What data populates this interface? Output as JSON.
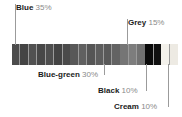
{
  "chart_data": {
    "type": "bar",
    "title": "",
    "subtitle": "",
    "xlabel": "",
    "ylabel": "",
    "orientation": "horizontal-stacked",
    "grid": false,
    "legend_position": "callout-labels",
    "total_percent": 100,
    "categories": [
      "Blue",
      "Blue-green",
      "Grey",
      "Black",
      "Cream"
    ],
    "values": [
      35,
      30,
      15,
      10,
      10
    ],
    "series": [
      {
        "name": "Color proportion",
        "values": [
          35,
          30,
          15,
          10,
          10
        ]
      }
    ],
    "annotations": [
      {
        "label": "Blue",
        "percent": "35%",
        "position": "top-left"
      },
      {
        "label": "Grey",
        "percent": "15%",
        "position": "top-right"
      },
      {
        "label": "Blue-green",
        "percent": "30%",
        "position": "bottom-left"
      },
      {
        "label": "Black",
        "percent": "10%",
        "position": "bottom-right"
      },
      {
        "label": "Cream",
        "percent": "10%",
        "position": "bottom-right"
      }
    ]
  },
  "labels": {
    "blue": {
      "name": "Blue",
      "percent": "35%"
    },
    "grey": {
      "name": "Grey",
      "percent": "15%"
    },
    "bluegreen": {
      "name": "Blue-green",
      "percent": "30%"
    },
    "black": {
      "name": "Black",
      "percent": "10%"
    },
    "cream": {
      "name": "Cream",
      "percent": "10%"
    }
  },
  "colors": {
    "blue_segment": "#4a4a4a",
    "bluegreen_segment": "#5a5a5a",
    "grey_segment": "#767676",
    "black_segment": "#0b0b0b",
    "cream_segment": "#f2f0ea",
    "stripe_divider": "#9a9a9a",
    "label_text": "#1b1b1b",
    "percent_text": "#8a8a8a",
    "leader_line": "#9b9b9b",
    "background": "#ffffff"
  },
  "segment_stripes": {
    "blue": [
      "#4c4c4c",
      "#444444",
      "#515151",
      "#474747",
      "#4e4e4e",
      "#434343",
      "#4a4a4a"
    ],
    "bluegreen": [
      "#585858",
      "#606060",
      "#555555",
      "#5d5d5d",
      "#595959",
      "#636363"
    ],
    "grey": [
      "#757575",
      "#7d7d7d",
      "#717171"
    ],
    "black": [
      "#0a0a0a",
      "#101010"
    ],
    "cream": [
      "#f3f1eb",
      "#edeae3"
    ]
  }
}
